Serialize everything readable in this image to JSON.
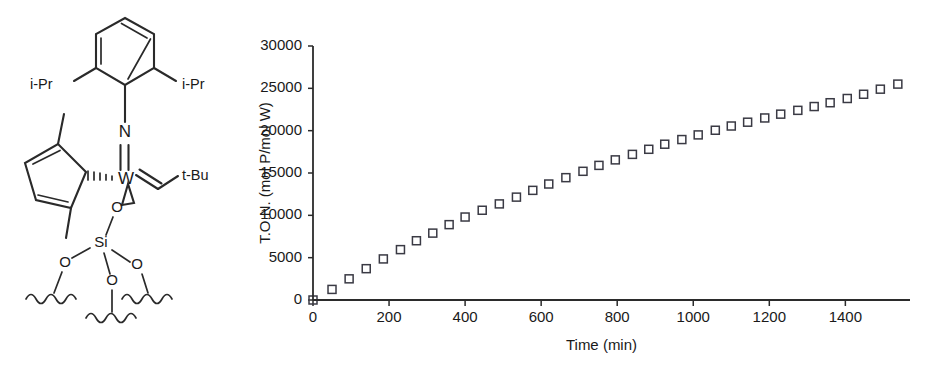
{
  "figure": {
    "panels": [
      "structure-panel",
      "chart-panel"
    ]
  },
  "structure": {
    "name": "silica-supported tungsten imido alkylidene complex",
    "atoms": [
      {
        "id": "W",
        "label": "W"
      },
      {
        "id": "N",
        "label": "N"
      },
      {
        "id": "O1",
        "label": "O"
      },
      {
        "id": "Si",
        "label": "Si"
      },
      {
        "id": "O2",
        "label": "O"
      },
      {
        "id": "O3",
        "label": "O"
      },
      {
        "id": "O4",
        "label": "O"
      }
    ],
    "groups": [
      {
        "id": "ipr-left",
        "label": "i-Pr"
      },
      {
        "id": "ipr-right",
        "label": "i-Pr"
      },
      {
        "id": "tbu",
        "label": "t-Bu"
      }
    ],
    "fragments": [
      "aryl-ring",
      "cyclopentadienyl-ring",
      "alkylidene",
      "siloxide-surface"
    ]
  },
  "chart_data": {
    "type": "scatter",
    "title": "",
    "xlabel": "Time (min)",
    "ylabel": "T.O.N. (mol P/mol W)",
    "xlim": [
      0,
      1570
    ],
    "ylim": [
      0,
      30000
    ],
    "xticks": [
      0,
      200,
      400,
      600,
      800,
      1000,
      1200,
      1400
    ],
    "xticklabels": [
      "0",
      "200",
      "400",
      "600",
      "800",
      "1000",
      "1200",
      "1400"
    ],
    "yticks": [
      0,
      5000,
      10000,
      15000,
      20000,
      25000,
      30000
    ],
    "yticklabels": [
      "0",
      "5000",
      "10000",
      "15000",
      "20000",
      "25000",
      "30000"
    ],
    "grid": false,
    "legend": null,
    "marker": "open-square",
    "marker_color": "#3a3a44",
    "series": [
      {
        "name": "T.O.N.",
        "x": [
          0,
          50,
          95,
          140,
          185,
          230,
          272,
          315,
          358,
          400,
          445,
          490,
          535,
          578,
          620,
          665,
          710,
          752,
          795,
          840,
          883,
          925,
          970,
          1013,
          1058,
          1100,
          1143,
          1188,
          1230,
          1275,
          1318,
          1360,
          1405,
          1448,
          1492,
          1538
        ],
        "y": [
          0,
          1250,
          2500,
          3700,
          4850,
          5950,
          7000,
          7900,
          8900,
          9800,
          10600,
          11350,
          12150,
          12950,
          13700,
          14450,
          15200,
          15900,
          16550,
          17200,
          17800,
          18400,
          18950,
          19500,
          20050,
          20550,
          21000,
          21500,
          21950,
          22400,
          22850,
          23300,
          23800,
          24300,
          24900,
          25500
        ]
      }
    ]
  }
}
